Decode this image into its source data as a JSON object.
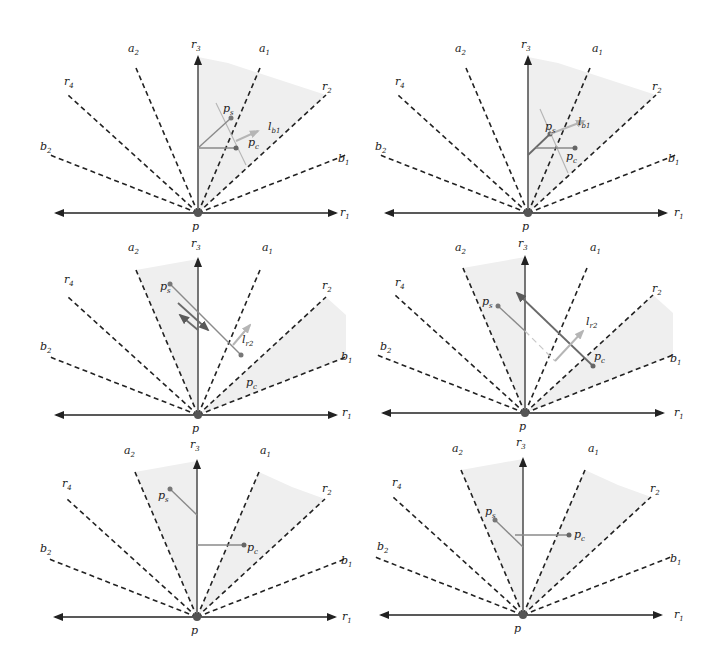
{
  "figure": {
    "layout": "3 rows x 2 columns",
    "colors": {
      "lines": "#222222",
      "shade": "#efefef",
      "gray_segment": "#8a8a8a",
      "light_arrow": "#b5b5b5"
    },
    "common_labels": {
      "origin": "p",
      "rays": [
        "r1",
        "r2",
        "r3",
        "r4"
      ],
      "a_rays": [
        "a1",
        "a2"
      ],
      "b_rays": [
        "b1",
        "b2"
      ],
      "ps": "p",
      "ps_sub": "s",
      "pc": "p",
      "pc_sub": "c"
    },
    "panels": [
      {
        "id": 1,
        "row": 1,
        "col": 1,
        "vector_label": "l",
        "vector_sub": "b1",
        "shaded": "between r3 and r2"
      },
      {
        "id": 2,
        "row": 1,
        "col": 2,
        "vector_label": "l",
        "vector_sub": "b1",
        "shaded": "between r3 and r2"
      },
      {
        "id": 3,
        "row": 2,
        "col": 1,
        "vector_label": "l",
        "vector_sub": "r2",
        "shaded": "between a2 and b1"
      },
      {
        "id": 4,
        "row": 2,
        "col": 2,
        "vector_label": "l",
        "vector_sub": "r2",
        "shaded": "between a2 and b1"
      },
      {
        "id": 5,
        "row": 3,
        "col": 1,
        "vector_label": "",
        "vector_sub": "",
        "shaded": "between a2 and r2"
      },
      {
        "id": 6,
        "row": 3,
        "col": 2,
        "vector_label": "",
        "vector_sub": "",
        "shaded": "between a2 and r2"
      }
    ]
  }
}
